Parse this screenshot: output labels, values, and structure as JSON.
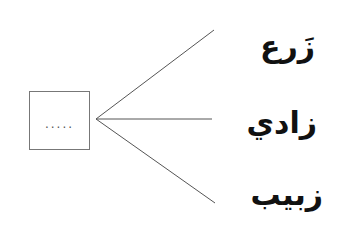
{
  "diagram": {
    "type": "word-branch-diagram",
    "blank_box": {
      "placeholder": "....."
    },
    "words": [
      {
        "text": "زَرع"
      },
      {
        "text": "زادي"
      },
      {
        "text": "زبيب"
      }
    ],
    "colors": {
      "line": "#555555",
      "box_border": "#777777",
      "text": "#111111"
    }
  }
}
